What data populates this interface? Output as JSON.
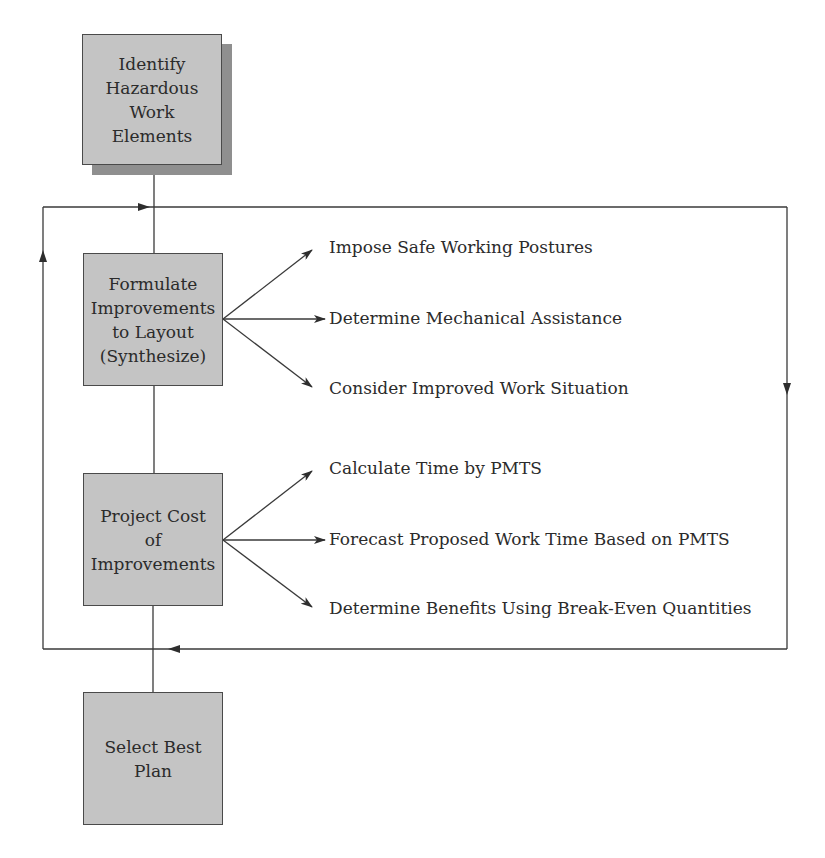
{
  "diagram": {
    "nodes": {
      "identify": {
        "lines": [
          "Identify",
          "Hazardous",
          "Work",
          "Elements"
        ]
      },
      "formulate": {
        "lines": [
          "Formulate",
          "Improvements",
          "to Layout",
          "(Synthesize)"
        ]
      },
      "project": {
        "lines": [
          "Project Cost",
          "of",
          "Improvements"
        ]
      },
      "select": {
        "lines": [
          "Select Best",
          "Plan"
        ]
      }
    },
    "formulate_outputs": [
      "Impose Safe Working Postures",
      "Determine Mechanical Assistance",
      "Consider Improved Work Situation"
    ],
    "project_outputs": [
      "Calculate Time by PMTS",
      "Forecast Proposed Work Time Based on PMTS",
      "Determine Benefits Using Break-Even Quantities"
    ],
    "colors": {
      "box_fill": "#c4c4c4",
      "box_border": "#4a4a4a",
      "shadow": "#8f8f8f",
      "line": "#3a3a3a"
    }
  }
}
